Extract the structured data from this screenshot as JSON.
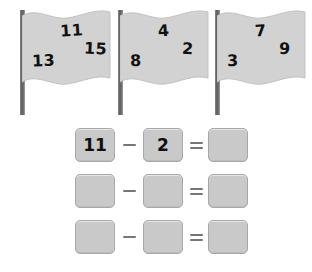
{
  "worksheet": {
    "flags": [
      {
        "name": "flag-one",
        "numbers": [
          {
            "value": "11",
            "position": "top-center"
          },
          {
            "value": "15",
            "position": "right-middle"
          },
          {
            "value": "13",
            "position": "lower-left"
          }
        ]
      },
      {
        "name": "flag-two",
        "numbers": [
          {
            "value": "4",
            "position": "top-center"
          },
          {
            "value": "2",
            "position": "right-middle"
          },
          {
            "value": "8",
            "position": "lower-left"
          }
        ]
      },
      {
        "name": "flag-three",
        "numbers": [
          {
            "value": "7",
            "position": "top-center"
          },
          {
            "value": "9",
            "position": "right-middle"
          },
          {
            "value": "3",
            "position": "lower-left"
          }
        ]
      }
    ],
    "equations": [
      {
        "minuend": "11",
        "operator": "−",
        "subtrahend": "2",
        "equals": "=",
        "difference": ""
      },
      {
        "minuend": "",
        "operator": "−",
        "subtrahend": "",
        "equals": "=",
        "difference": ""
      },
      {
        "minuend": "",
        "operator": "−",
        "subtrahend": "",
        "equals": "=",
        "difference": ""
      }
    ]
  },
  "colors": {
    "flag_fill": "#d2d2d2",
    "flag_stroke": "#bdbdbd",
    "pole": "#5e5e5e",
    "box_fill": "#c9c9c9",
    "box_border": "#a8a8a8",
    "operator": "#767676",
    "digit": "#111111",
    "page_background": "#ffffff"
  }
}
